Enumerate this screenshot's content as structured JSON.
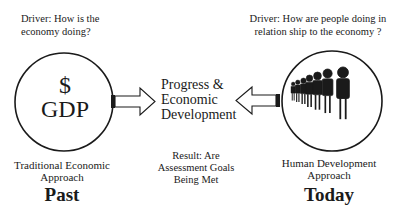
{
  "left": {
    "driver_line1": "Driver: How is the",
    "driver_line2": "economy doing?",
    "symbol": "$",
    "metric": "GDP",
    "approach_line1": "Traditional Economic",
    "approach_line2": "Approach",
    "era": "Past",
    "icon": "dollar-gdp"
  },
  "right": {
    "driver_line1": "Driver: How are people doing in",
    "driver_line2": "relation ship to the economy ?",
    "approach_line1": "Human Development",
    "approach_line2": "Approach",
    "era": "Today",
    "icon": "people-queue"
  },
  "center": {
    "line1": "Progress &",
    "line2": "Economic",
    "line3": "Development",
    "result_line1": "Result: Are",
    "result_line2": "Assessment Goals",
    "result_line3": "Being Met"
  },
  "colors": {
    "stroke": "#1a1a1a",
    "background": "#ffffff"
  }
}
